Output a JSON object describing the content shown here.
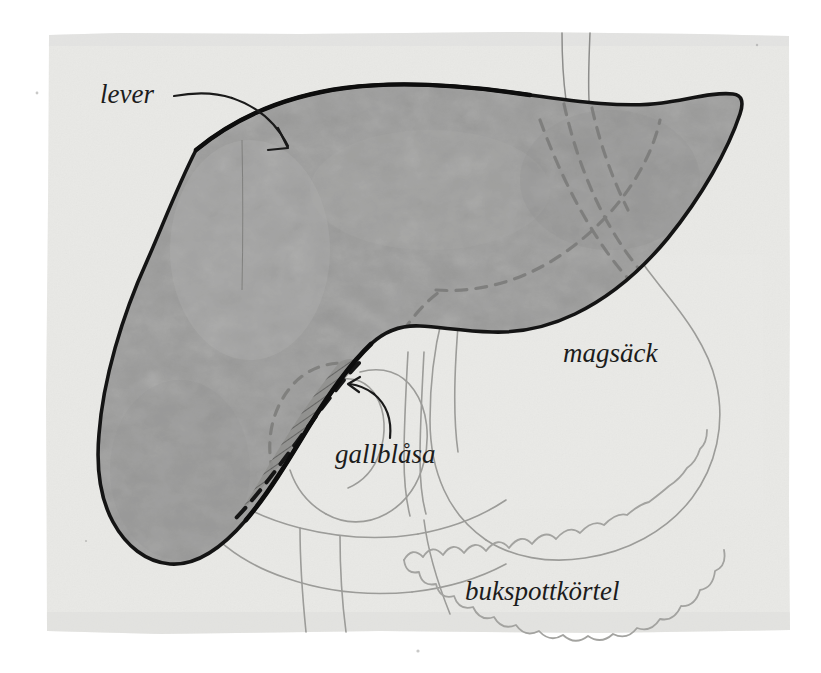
{
  "figure": {
    "language": "sv",
    "page_background_color": "#e9e9e6",
    "outer_background_color": "#ffffff",
    "liver_fill_color": "#9b9b9a",
    "liver_outline_color": "#141414",
    "faint_outline_color": "#9a9a98",
    "dashed_outline_color": "#8a8a88",
    "label_color": "#1c1c1c"
  },
  "labels": [
    {
      "id": "lever",
      "text": "lever",
      "x": 100,
      "y": 103,
      "font_size": 27,
      "has_arrow": true,
      "arrow_description": "curved arrow pointing down-right into the liver"
    },
    {
      "id": "magsack",
      "text": "magsäck",
      "x": 563,
      "y": 362,
      "font_size": 27,
      "has_arrow": false,
      "arrow_description": ""
    },
    {
      "id": "gallblasa",
      "text": "gallblåsa",
      "x": 335,
      "y": 463,
      "font_size": 27,
      "has_arrow": true,
      "arrow_description": "curved arrow pointing up-left to the hatched gallbladder"
    },
    {
      "id": "bukspottkortel",
      "text": "bukspottkörtel",
      "x": 465,
      "y": 600,
      "font_size": 27,
      "has_arrow": false,
      "arrow_description": ""
    }
  ],
  "organs": [
    {
      "id": "liver",
      "label": "lever",
      "rendering": "solid gray fill with bold black outline"
    },
    {
      "id": "stomach",
      "label": "magsäck",
      "rendering": "faint gray outline, dashed where hidden behind liver"
    },
    {
      "id": "gallbladder",
      "label": "gallblåsa",
      "rendering": "hatched crescent with bold dashed border"
    },
    {
      "id": "pancreas",
      "label": "bukspottkörtel",
      "rendering": "faint scalloped lobulated outline"
    },
    {
      "id": "esophagus",
      "label": "",
      "rendering": "two thin vertical lines entering from the top"
    },
    {
      "id": "duodenum",
      "label": "",
      "rendering": "faint C-shaped loop below the liver, dashed where hidden"
    }
  ]
}
